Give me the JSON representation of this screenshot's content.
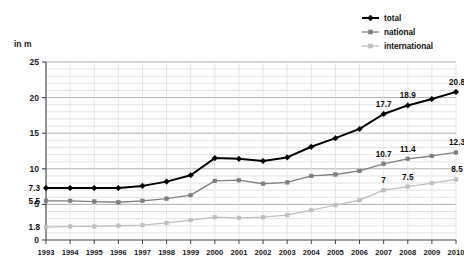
{
  "chart_data": {
    "type": "line",
    "title": "",
    "subtitle": "",
    "xlabel": "",
    "ylabel": "in m",
    "unit_label": "in m",
    "ylim": [
      0,
      25
    ],
    "yticks": [
      0,
      5,
      10,
      15,
      20,
      25
    ],
    "ytick_labels": [
      "0",
      "5",
      "10",
      "15",
      "20",
      "25"
    ],
    "grid": true,
    "grid_major_step": 5,
    "grid_minor_step": 1,
    "legend_position": "top-right",
    "categories": [
      "1993",
      "1994",
      "1995",
      "1996",
      "1997",
      "1998",
      "1999",
      "2000",
      "2001",
      "2002",
      "2003",
      "2004",
      "2005",
      "2006",
      "2007",
      "2008",
      "2009",
      "2010"
    ],
    "series": [
      {
        "name": "total",
        "color": "#000000",
        "marker": "diamond",
        "values": [
          7.3,
          7.3,
          7.3,
          7.3,
          7.6,
          8.2,
          9.1,
          11.5,
          11.4,
          11.1,
          11.6,
          13.1,
          14.3,
          15.6,
          17.7,
          18.9,
          19.8,
          20.8
        ],
        "labels": [
          {
            "category": "1993",
            "value": 7.3,
            "text": "7.3"
          },
          {
            "category": "2007",
            "value": 17.7,
            "text": "17.7"
          },
          {
            "category": "2008",
            "value": 18.9,
            "text": "18.9"
          },
          {
            "category": "2010",
            "value": 20.8,
            "text": "20.8"
          }
        ]
      },
      {
        "name": "national",
        "color": "#7f7f7f",
        "marker": "square",
        "values": [
          5.5,
          5.5,
          5.4,
          5.3,
          5.5,
          5.8,
          6.3,
          8.3,
          8.4,
          7.9,
          8.1,
          9.0,
          9.2,
          9.7,
          10.7,
          11.4,
          11.8,
          12.3
        ],
        "labels": [
          {
            "category": "1993",
            "value": 5.5,
            "text": "5.5"
          },
          {
            "category": "2007",
            "value": 10.7,
            "text": "10.7"
          },
          {
            "category": "2008",
            "value": 11.4,
            "text": "11.4"
          },
          {
            "category": "2010",
            "value": 12.3,
            "text": "12.3"
          }
        ]
      },
      {
        "name": "international",
        "color": "#bfbfbf",
        "marker": "square",
        "values": [
          1.8,
          1.9,
          1.9,
          2.0,
          2.1,
          2.4,
          2.8,
          3.2,
          3.1,
          3.2,
          3.5,
          4.2,
          4.9,
          5.6,
          7.0,
          7.5,
          8.0,
          8.5
        ],
        "labels": [
          {
            "category": "1993",
            "value": 1.8,
            "text": "1.8"
          },
          {
            "category": "2007",
            "value": 7.0,
            "text": "7"
          },
          {
            "category": "2008",
            "value": 7.5,
            "text": "7.5"
          },
          {
            "category": "2010",
            "value": 8.5,
            "text": "8.5"
          }
        ]
      }
    ]
  },
  "legend": {
    "items": [
      {
        "label": "total",
        "color": "#000000"
      },
      {
        "label": "national",
        "color": "#7f7f7f"
      },
      {
        "label": "international",
        "color": "#bfbfbf"
      }
    ]
  }
}
